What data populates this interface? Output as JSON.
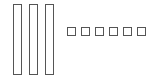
{
  "colors": {
    "stroke": "#555555",
    "background": "#ffffff"
  },
  "tall_rectangles": [
    {
      "x": 13,
      "y": 4,
      "w": 9,
      "h": 71
    },
    {
      "x": 29,
      "y": 4,
      "w": 9,
      "h": 71
    },
    {
      "x": 45,
      "y": 4,
      "w": 9,
      "h": 71
    }
  ],
  "small_squares": [
    {
      "x": 67,
      "y": 27,
      "w": 9,
      "h": 9
    },
    {
      "x": 81,
      "y": 27,
      "w": 9,
      "h": 9
    },
    {
      "x": 95,
      "y": 27,
      "w": 9,
      "h": 9
    },
    {
      "x": 109,
      "y": 27,
      "w": 9,
      "h": 9
    },
    {
      "x": 123,
      "y": 27,
      "w": 9,
      "h": 9
    },
    {
      "x": 137,
      "y": 27,
      "w": 9,
      "h": 9
    }
  ]
}
